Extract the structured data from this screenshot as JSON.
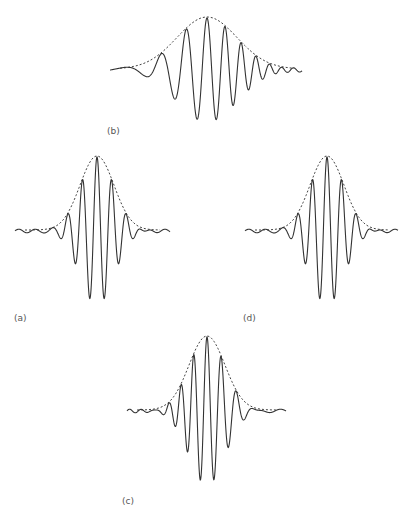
{
  "figure": {
    "background": "#ffffff",
    "line_color": "#333333",
    "envelope_color": "#444444",
    "panels": [
      {
        "id": "b",
        "label": "(b)",
        "label_pos": [
          107,
          126
        ],
        "description": "up-chirp wave packet (frequency increases left to right) with dashed Gaussian envelope",
        "x_start": 110,
        "x_end": 302,
        "baseline_y": 70,
        "peak_x": 207,
        "amplitude": 52,
        "sigma": 30,
        "chirp": "up",
        "freq_start": 0.1,
        "freq_end": 0.55
      },
      {
        "id": "a",
        "label": "(a)",
        "label_pos": [
          14,
          313
        ],
        "description": "symmetric wave packet (constant frequency) with dashed Gaussian envelope",
        "x_start": 15,
        "x_end": 170,
        "baseline_y": 231,
        "peak_x": 97,
        "amplitude": 74,
        "sigma": 17,
        "chirp": "none",
        "freq_start": 0.43,
        "freq_end": 0.43
      },
      {
        "id": "d",
        "label": "(d)",
        "label_pos": [
          243,
          313
        ],
        "description": "symmetric wave packet (constant frequency) with dashed Gaussian envelope",
        "x_start": 245,
        "x_end": 398,
        "baseline_y": 231,
        "peak_x": 327,
        "amplitude": 74,
        "sigma": 17,
        "chirp": "none",
        "freq_start": 0.43,
        "freq_end": 0.43
      },
      {
        "id": "c",
        "label": "(c)",
        "label_pos": [
          122,
          496
        ],
        "description": "down-chirp wave packet (frequency decreases left to right) with dashed Gaussian envelope",
        "x_start": 127,
        "x_end": 286,
        "baseline_y": 411,
        "peak_x": 207,
        "amplitude": 74,
        "sigma": 18,
        "chirp": "down",
        "freq_start": 0.62,
        "freq_end": 0.3
      }
    ]
  }
}
